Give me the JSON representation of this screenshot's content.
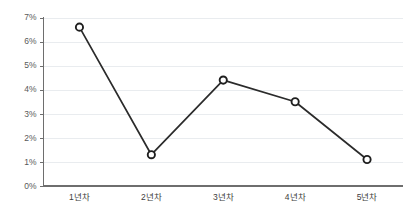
{
  "chart_data": {
    "type": "line",
    "title": "",
    "subtitle": "",
    "xlabel": "",
    "ylabel": "",
    "categories": [
      "1년차",
      "2년차",
      "3년차",
      "4년차",
      "5년차"
    ],
    "values": [
      6.6,
      1.3,
      4.4,
      3.5,
      1.1
    ],
    "value_unit": "%",
    "ylim": [
      0,
      7
    ],
    "ytick_values": [
      0,
      1,
      2,
      3,
      4,
      5,
      6,
      7
    ],
    "ytick_labels": [
      "0%",
      "1%",
      "2%",
      "3%",
      "4%",
      "5%",
      "6%",
      "7%"
    ],
    "grid": true,
    "grid_axis": "y",
    "legend": false,
    "legend_position": "none",
    "marker": "circle-open",
    "series": [
      {
        "name": "",
        "values": [
          6.6,
          1.3,
          4.4,
          3.5,
          1.1
        ]
      }
    ],
    "colors": {
      "line": "#2b2b2b",
      "marker_fill": "#ffffff",
      "marker_stroke": "#1f1f1f",
      "gridline": "#e9ecef",
      "axis": "#6e6e6e",
      "tick_label": "#595959",
      "background": "#ffffff"
    }
  }
}
